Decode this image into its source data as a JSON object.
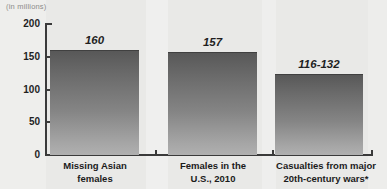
{
  "chart_data": {
    "type": "bar",
    "title": "",
    "clipped_title": "",
    "subtitle": "(in millions)",
    "units_note": "(in millions)",
    "categories": [
      "Missing Asian\nfemales",
      "Females in the\nU.S., 2010",
      "Casualties from major\n20th-century wars*"
    ],
    "values": [
      160,
      157,
      124
    ],
    "value_labels": [
      "160",
      "157",
      "116-132"
    ],
    "xlabel": "",
    "ylabel": "",
    "ylim": [
      0,
      200
    ],
    "yticks": [
      200,
      150,
      100,
      50,
      0
    ],
    "ytick_labels": [
      "200",
      "150",
      "100",
      "50",
      "0"
    ],
    "grid": false,
    "legend": false,
    "footnote_marker": "*"
  },
  "colors": {
    "background": "#e9e9e7",
    "bar_top": "#585858",
    "bar_bottom": "#b0b0b0",
    "axis": "#3a3a3a",
    "text": "#1f1f1f",
    "muted_text": "#8c8c8a"
  }
}
